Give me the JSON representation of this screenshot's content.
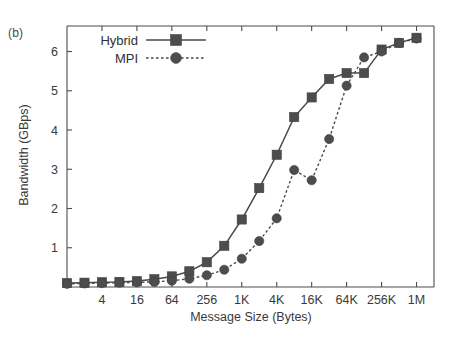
{
  "figure": {
    "panel_label": "(b)",
    "background_color": "#ffffff",
    "ink_color": "#4d4d4d"
  },
  "chart_data": {
    "type": "line",
    "title": "",
    "subtitle": "",
    "xlabel": "Message Size (Bytes)",
    "ylabel": "Bandwidth (GBps)",
    "xscale": "log2",
    "grid": false,
    "legend_position": "top-left-inside",
    "x_tick_labels": [
      "4",
      "16",
      "64",
      "256",
      "1K",
      "4K",
      "16K",
      "64K",
      "256K",
      "1M"
    ],
    "x_tick_values": [
      4,
      16,
      64,
      256,
      1024,
      4096,
      16384,
      65536,
      262144,
      1048576
    ],
    "y_tick_labels": [
      "1",
      "2",
      "3",
      "4",
      "5",
      "6"
    ],
    "y_tick_values": [
      1,
      2,
      3,
      4,
      5,
      6
    ],
    "xlim": [
      1,
      2097152
    ],
    "ylim": [
      0,
      6.65
    ],
    "x": [
      1,
      2,
      4,
      8,
      16,
      32,
      64,
      128,
      256,
      512,
      1024,
      2048,
      4096,
      8192,
      16384,
      32768,
      65536,
      131072,
      262144,
      524288,
      1048576
    ],
    "series": [
      {
        "name": "Hybrid",
        "marker": "square",
        "linestyle": "solid",
        "color": "#4d4d4d",
        "values": [
          0.1,
          0.11,
          0.12,
          0.13,
          0.15,
          0.2,
          0.27,
          0.4,
          0.63,
          1.05,
          1.72,
          2.52,
          3.37,
          4.33,
          4.83,
          5.3,
          5.45,
          5.45,
          6.05,
          6.22,
          6.35
        ]
      },
      {
        "name": "MPI",
        "marker": "circle",
        "linestyle": "dotted",
        "color": "#4d4d4d",
        "values": [
          0.08,
          0.09,
          0.1,
          0.11,
          0.12,
          0.13,
          0.16,
          0.21,
          0.3,
          0.44,
          0.72,
          1.17,
          1.75,
          2.98,
          2.72,
          3.77,
          5.13,
          5.85,
          6.0,
          6.22,
          6.33
        ]
      }
    ]
  },
  "legend": {
    "entries": [
      {
        "label": "Hybrid",
        "marker": "square-marker",
        "linestyle": "solid"
      },
      {
        "label": "MPI",
        "marker": "circle-marker",
        "linestyle": "dotted"
      }
    ]
  }
}
